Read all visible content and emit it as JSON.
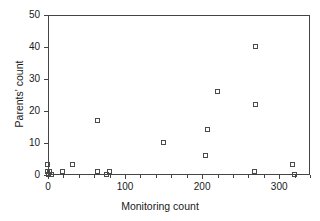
{
  "chart_data": {
    "type": "scatter",
    "title": "",
    "xlabel": "Monitoring count",
    "ylabel": "Parents' count",
    "xlim": [
      0,
      340
    ],
    "ylim": [
      0,
      50
    ],
    "xticks": [
      0,
      100,
      200,
      300
    ],
    "xtick_labels": [
      "0",
      "100",
      "200",
      "300"
    ],
    "xminor_step": 20,
    "yticks": [
      0,
      10,
      20,
      30,
      40,
      50
    ],
    "ytick_labels": [
      "0",
      "10",
      "20",
      "30",
      "40",
      "50"
    ],
    "grid": false,
    "legend": null,
    "marker": "open-square",
    "marker_color": "#4a4a4a",
    "points": [
      {
        "x": 0,
        "y": 3
      },
      {
        "x": 0,
        "y": 1
      },
      {
        "x": 1,
        "y": 0
      },
      {
        "x": 3,
        "y": 1
      },
      {
        "x": 5,
        "y": 0
      },
      {
        "x": 20,
        "y": 1
      },
      {
        "x": 33,
        "y": 3
      },
      {
        "x": 65,
        "y": 1
      },
      {
        "x": 65,
        "y": 17
      },
      {
        "x": 76,
        "y": 0
      },
      {
        "x": 81,
        "y": 1
      },
      {
        "x": 150,
        "y": 10
      },
      {
        "x": 205,
        "y": 6
      },
      {
        "x": 207,
        "y": 14
      },
      {
        "x": 220,
        "y": 26
      },
      {
        "x": 268,
        "y": 1
      },
      {
        "x": 270,
        "y": 22
      },
      {
        "x": 270,
        "y": 40
      },
      {
        "x": 318,
        "y": 3
      },
      {
        "x": 320,
        "y": 0
      }
    ]
  }
}
